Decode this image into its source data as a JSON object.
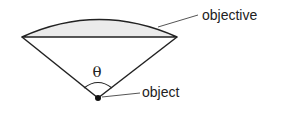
{
  "diagram": {
    "labels": {
      "objective": "objective",
      "object": "object",
      "angle": "θ"
    },
    "colors": {
      "stroke": "#222222",
      "lens_fill": "#ebebeb",
      "leader": "#555555",
      "background": "#ffffff"
    }
  }
}
